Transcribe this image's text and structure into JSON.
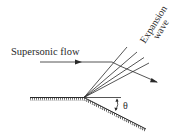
{
  "diagram": {
    "labels": {
      "flow": "Supersonic flow",
      "wave_line1": "Expansion",
      "wave_line2": "wave",
      "angle": "θ"
    },
    "colors": {
      "ink": "#2a2a2a",
      "background": "#ffffff"
    },
    "fan_line_count": 4
  }
}
